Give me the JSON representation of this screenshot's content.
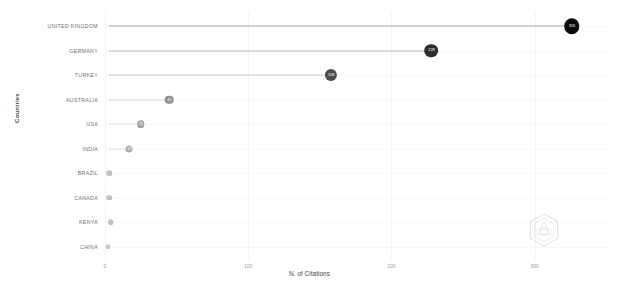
{
  "chart_data": {
    "type": "bar",
    "subtype": "lollipop-horizontal",
    "title": "",
    "xlabel": "N. of Citations",
    "ylabel": "Countries",
    "categories": [
      "UNITED KINGDOM",
      "GERMANY",
      "TURKEY",
      "AUSTRALIA",
      "USA",
      "INDIA",
      "BRAZIL",
      "CANADA",
      "KENYA",
      "CHINA"
    ],
    "values": [
      326,
      228,
      158,
      45,
      25,
      17,
      3,
      3,
      4,
      2
    ],
    "point_labels": [
      "326",
      "228",
      "158",
      "45",
      "25",
      "17",
      "",
      "",
      "",
      ""
    ],
    "xlim": [
      0,
      340
    ],
    "xticks": [
      0,
      100,
      200,
      300
    ],
    "xtick_labels": [
      "0",
      "100",
      "200",
      "300"
    ],
    "grid": true,
    "legend": false,
    "orientation": "horizontal",
    "colors": {
      "max_point": "#111111",
      "high_point": "#3a3a3a",
      "mid_point": "#6f6f6f",
      "low_point": "#b4b4b4",
      "min_point": "#cfcfcf",
      "stem": "#9a9a9a",
      "grid": "#f4f4f4",
      "axis_text": "#9b9b9b",
      "label_text": "#6d6d6d"
    }
  },
  "axes": {
    "x_title": "N. of Citations",
    "y_title": "Countries"
  },
  "watermark": {
    "name": "hexagon-logo-watermark"
  }
}
